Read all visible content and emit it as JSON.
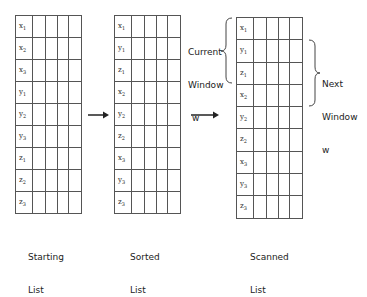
{
  "lists": [
    {
      "name": "starting",
      "caption_line1": "Starting",
      "caption_line2": "List",
      "rows": [
        "x1",
        "x2",
        "x3",
        "y1",
        "y2",
        "y3",
        "z1",
        "z2",
        "z3"
      ],
      "rows_display": [
        [
          "x",
          "1"
        ],
        [
          "x",
          "2"
        ],
        [
          "x",
          "3"
        ],
        [
          "y",
          "1"
        ],
        [
          "y",
          "2"
        ],
        [
          "y",
          "3"
        ],
        [
          "z",
          "1"
        ],
        [
          "z",
          "2"
        ],
        [
          "z",
          "3"
        ]
      ]
    },
    {
      "name": "sorted",
      "caption_line1": "Sorted",
      "caption_line2": "List",
      "rows": [
        "x1",
        "y1",
        "z1",
        "x2",
        "y2",
        "z2",
        "x3",
        "y3",
        "z3"
      ],
      "rows_display": [
        [
          "x",
          "1"
        ],
        [
          "y",
          "1"
        ],
        [
          "z",
          "1"
        ],
        [
          "x",
          "2"
        ],
        [
          "y",
          "2"
        ],
        [
          "z",
          "2"
        ],
        [
          "x",
          "3"
        ],
        [
          "y",
          "3"
        ],
        [
          "z",
          "3"
        ]
      ]
    },
    {
      "name": "scanned",
      "caption_line1": "Scanned",
      "caption_line2": "List",
      "rows": [
        "x1",
        "y1",
        "z1",
        "x2",
        "y2",
        "z2",
        "x3",
        "y3",
        "z3"
      ],
      "rows_display": [
        [
          "x",
          "1"
        ],
        [
          "y",
          "1"
        ],
        [
          "z",
          "1"
        ],
        [
          "x",
          "2"
        ],
        [
          "y",
          "2"
        ],
        [
          "z",
          "2"
        ],
        [
          "x",
          "3"
        ],
        [
          "y",
          "3"
        ],
        [
          "z",
          "3"
        ]
      ]
    }
  ],
  "windows": {
    "current": {
      "line1": "Current",
      "line2": "Window",
      "line3": "w"
    },
    "next": {
      "line1": "Next",
      "line2": "Window",
      "line3": "w"
    }
  },
  "arrows": [
    {
      "from": "starting",
      "to": "sorted"
    },
    {
      "from": "sorted",
      "to": "scanned"
    }
  ]
}
